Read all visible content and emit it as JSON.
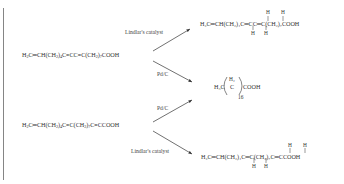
{
  "reactants": [
    {
      "id": "top",
      "formula_parts": [
        "H",
        "2",
        "C",
        "═",
        "CH(CH",
        "2",
        ")",
        "4",
        "C",
        "≡",
        "CC",
        "≡",
        "C(CH",
        "2",
        ")",
        "7",
        "COOH"
      ]
    },
    {
      "id": "bottom",
      "formula_parts": [
        "H",
        "2",
        "C",
        "═",
        "CH(CH",
        "2",
        ")",
        "4",
        "C",
        "≡",
        "C(CH",
        "2",
        ")",
        "7",
        "C",
        "≡",
        "CCOOH"
      ]
    }
  ],
  "catalysts": {
    "top_upper": "Lindlar's catalyst",
    "top_lower": "Pd/C",
    "bottom_upper": "Pd/C",
    "bottom_lower": "Lindlar's catalyst"
  },
  "products": {
    "top": {
      "left": "H₂C═CH(CH₂)₄C",
      "mid1": "═",
      "c2": "CC",
      "mid2": "═",
      "right": "C(CH₂)₇COOH",
      "h_label": "H"
    },
    "middle": {
      "left": "H₃C",
      "center": "C",
      "h2": "H₂",
      "right": "COOH",
      "subscript": "16"
    },
    "bottom": {
      "left": "H₂C═CH(CH₂)₄C",
      "mid1": "═",
      "c2": "C(CH₂)₇C",
      "mid2": "═",
      "right": "CCOOH",
      "h_label": "H"
    }
  }
}
